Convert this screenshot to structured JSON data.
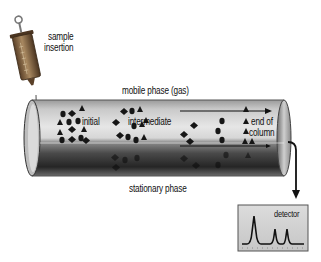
{
  "diagram": {
    "type": "gas-chromatography-schematic",
    "labels": {
      "sample_insertion_line1": "sample",
      "sample_insertion_line2": "insertion",
      "mobile_phase": "mobile phase (gas)",
      "initial": "initial",
      "intermediate": "intermediate",
      "end_of_column_line1": "end of",
      "end_of_column_line2": "column",
      "stationary_phase": "stationary phase",
      "detector": "detector"
    },
    "components": [
      {
        "name": "syringe",
        "role": "sample injector"
      },
      {
        "name": "column",
        "role": "tube containing mobile and stationary phases"
      },
      {
        "name": "flow-arrow",
        "role": "direction of mobile phase flow"
      },
      {
        "name": "detector",
        "role": "chromatogram output with 3 peaks"
      }
    ],
    "detector_peaks": [
      {
        "position": 0.2,
        "height": 0.85
      },
      {
        "position": 0.58,
        "height": 0.45
      },
      {
        "position": 0.8,
        "height": 0.45
      }
    ],
    "stages": [
      "initial",
      "intermediate",
      "end of column"
    ],
    "colors": {
      "tube_light": "#d8d8d8",
      "tube_dark": "#2a2a2a",
      "particles": "#1a1a1a",
      "detector_bg": "#d4d4d4",
      "syringe_body": "#7a5a3a"
    }
  }
}
